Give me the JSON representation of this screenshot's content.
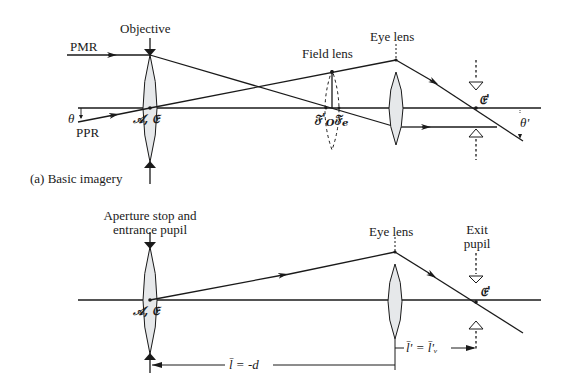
{
  "top": {
    "caption": "(a) Basic imagery",
    "objective_label": "Objective",
    "pmr_label": "PMR",
    "ppr_label": "PPR",
    "theta_label": "θ",
    "theta_prime_label": "θ'",
    "field_lens_label": "Field lens",
    "eye_lens_label": "Eye lens",
    "ae_label": "𝒜, 𝔈",
    "fo_label": "𝔉'",
    "fo_sub": "O",
    "fc_label": "𝔉",
    "fc_sub": "e",
    "eprime_label": "𝔈'"
  },
  "bottom": {
    "aperture_label_line1": "Aperture stop and",
    "aperture_label_line2": "entrance pupil",
    "eye_lens_label": "Eye lens",
    "exit_label_line1": "Exit",
    "exit_label_line2": "pupil",
    "ae_label": "𝒜, 𝔈",
    "eprime_label": "𝔈'",
    "dim_l": "l̄ = -d",
    "dim_lprime": "l̄' = l̄'ᵥ"
  },
  "colors": {
    "line": "#1a1a1a",
    "lens_fill": "#e6e8ea"
  }
}
